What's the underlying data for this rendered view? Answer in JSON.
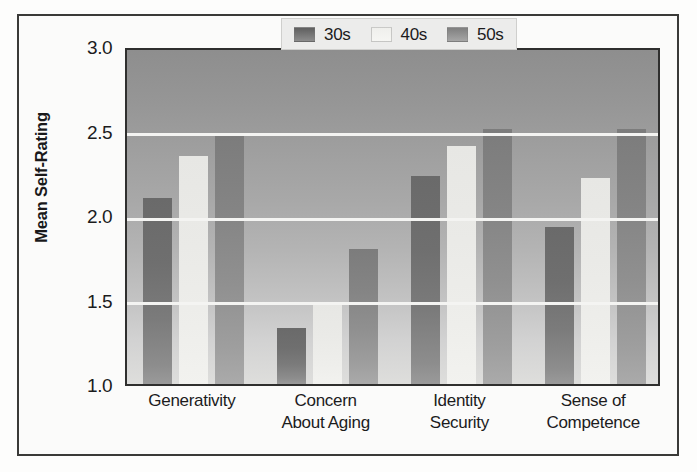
{
  "chart_data": {
    "type": "bar",
    "title": "",
    "xlabel": "",
    "ylabel": "Mean Self-Rating",
    "ylim": [
      1.0,
      3.0
    ],
    "ytick_labels": [
      "3.0",
      "2.5",
      "2.0",
      "1.5",
      "1.0"
    ],
    "ytick_values": [
      3.0,
      2.5,
      2.0,
      1.5,
      1.0
    ],
    "grid": true,
    "legend_position": "top-right",
    "categories": [
      "Generativity",
      "Concern About Aging",
      "Identity Security",
      "Sense of Competence"
    ],
    "category_lines": [
      [
        "Generativity",
        ""
      ],
      [
        "Concern",
        "About Aging"
      ],
      [
        "Identity",
        "Security"
      ],
      [
        "Sense of",
        "Competence"
      ]
    ],
    "series": [
      {
        "name": "30s",
        "color": "#6f6f6f",
        "values": [
          2.1,
          1.33,
          2.23,
          1.93
        ]
      },
      {
        "name": "40s",
        "color": "#ececea",
        "values": [
          2.35,
          1.48,
          2.41,
          2.22
        ]
      },
      {
        "name": "50s",
        "color": "#8b8b8b",
        "values": [
          2.48,
          1.8,
          2.51,
          2.51
        ]
      }
    ]
  },
  "legend": {
    "items": [
      {
        "label": "30s",
        "swatch": "legend-swatch-30s"
      },
      {
        "label": "40s",
        "swatch": "legend-swatch-40s"
      },
      {
        "label": "50s",
        "swatch": "legend-swatch-50s"
      }
    ]
  },
  "axis": {
    "y_title": "Mean Self-Rating"
  },
  "colors": {
    "plot_background_top": "#8e8e8e",
    "plot_background_bottom": "#dededc",
    "gridline": "#f4f4f2",
    "frame": "#3a3a38",
    "text": "#1c1c1d",
    "legend_background": "#ececeb"
  }
}
